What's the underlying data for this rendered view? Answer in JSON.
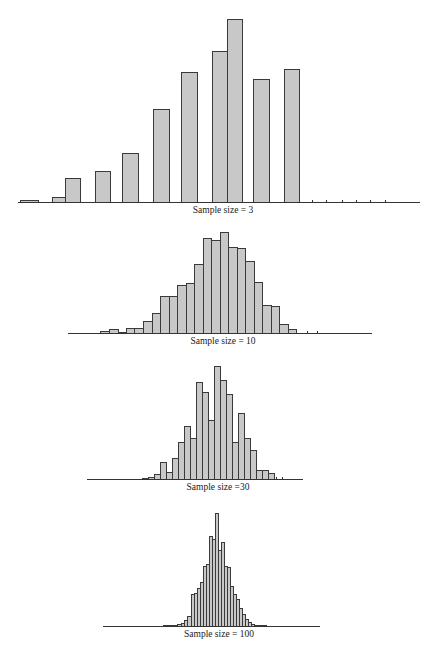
{
  "colors": {
    "bar_fill": "#c8c8c8",
    "bar_stroke": "#3a3a3a",
    "axis": "#333333"
  },
  "chart_data": [
    {
      "type": "bar",
      "title": "",
      "caption": "Sample size = 3",
      "xlabel": "Sample size = 3",
      "ylabel": "",
      "grid": false,
      "axis": {
        "x1": 18,
        "x2": 420,
        "y": 202
      },
      "caption_pos": {
        "x": 223,
        "y": 205
      },
      "bars": [
        {
          "x": 20,
          "w": 18,
          "h": 2
        },
        {
          "x": 52,
          "w": 13,
          "h": 5
        },
        {
          "x": 65,
          "w": 15,
          "h": 24
        },
        {
          "x": 95,
          "w": 15,
          "h": 31
        },
        {
          "x": 122,
          "w": 16,
          "h": 49
        },
        {
          "x": 153,
          "w": 16,
          "h": 93
        },
        {
          "x": 181,
          "w": 16,
          "h": 130
        },
        {
          "x": 212,
          "w": 15,
          "h": 151
        },
        {
          "x": 227,
          "w": 15,
          "h": 183
        },
        {
          "x": 253,
          "w": 16,
          "h": 123
        },
        {
          "x": 284,
          "w": 15,
          "h": 133
        }
      ],
      "ticks": [
        312,
        326,
        342,
        356,
        370,
        385
      ],
      "values": [
        2,
        5,
        24,
        31,
        49,
        93,
        130,
        151,
        183,
        123,
        133,
        0,
        0,
        0,
        0,
        0,
        0
      ]
    },
    {
      "type": "bar",
      "title": "",
      "caption": "Sample size = 10",
      "xlabel": "Sample size = 10",
      "ylabel": "",
      "grid": false,
      "axis": {
        "x1": 68,
        "x2": 372,
        "y": 333
      },
      "caption_pos": {
        "x": 223,
        "y": 336
      },
      "bars": [
        {
          "x": 100,
          "w": 9,
          "h": 2
        },
        {
          "x": 109,
          "w": 9,
          "h": 4
        },
        {
          "x": 118,
          "w": 8,
          "h": 1
        },
        {
          "x": 126,
          "w": 8,
          "h": 5
        },
        {
          "x": 134,
          "w": 9,
          "h": 5
        },
        {
          "x": 143,
          "w": 9,
          "h": 12
        },
        {
          "x": 152,
          "w": 8,
          "h": 20
        },
        {
          "x": 160,
          "w": 9,
          "h": 37
        },
        {
          "x": 169,
          "w": 8,
          "h": 37
        },
        {
          "x": 177,
          "w": 9,
          "h": 48
        },
        {
          "x": 186,
          "w": 8,
          "h": 50
        },
        {
          "x": 194,
          "w": 9,
          "h": 69
        },
        {
          "x": 203,
          "w": 8,
          "h": 95
        },
        {
          "x": 211,
          "w": 9,
          "h": 93
        },
        {
          "x": 220,
          "w": 8,
          "h": 101
        },
        {
          "x": 228,
          "w": 9,
          "h": 86
        },
        {
          "x": 237,
          "w": 8,
          "h": 85
        },
        {
          "x": 245,
          "w": 9,
          "h": 72
        },
        {
          "x": 254,
          "w": 8,
          "h": 51
        },
        {
          "x": 262,
          "w": 9,
          "h": 28
        },
        {
          "x": 271,
          "w": 8,
          "h": 27
        },
        {
          "x": 279,
          "w": 9,
          "h": 9
        },
        {
          "x": 288,
          "w": 8,
          "h": 4
        }
      ],
      "ticks": [
        307,
        317
      ],
      "values": [
        2,
        4,
        1,
        5,
        5,
        12,
        20,
        37,
        37,
        48,
        50,
        69,
        95,
        93,
        101,
        86,
        85,
        72,
        51,
        28,
        27,
        9,
        4,
        0,
        0
      ]
    },
    {
      "type": "bar",
      "title": "",
      "caption": "Sample size =30",
      "xlabel": "Sample size =30",
      "ylabel": "",
      "grid": false,
      "axis": {
        "x1": 87,
        "x2": 303,
        "y": 479
      },
      "caption_pos": {
        "x": 218,
        "y": 482
      },
      "bars": [
        {
          "x": 142,
          "w": 6,
          "h": 1
        },
        {
          "x": 148,
          "w": 6,
          "h": 2
        },
        {
          "x": 154,
          "w": 6,
          "h": 5
        },
        {
          "x": 160,
          "w": 6,
          "h": 17
        },
        {
          "x": 166,
          "w": 6,
          "h": 7
        },
        {
          "x": 172,
          "w": 6,
          "h": 21
        },
        {
          "x": 178,
          "w": 6,
          "h": 37
        },
        {
          "x": 184,
          "w": 6,
          "h": 53
        },
        {
          "x": 190,
          "w": 6,
          "h": 41
        },
        {
          "x": 196,
          "w": 6,
          "h": 97
        },
        {
          "x": 202,
          "w": 6,
          "h": 87
        },
        {
          "x": 208,
          "w": 6,
          "h": 59
        },
        {
          "x": 214,
          "w": 6,
          "h": 113
        },
        {
          "x": 220,
          "w": 6,
          "h": 99
        },
        {
          "x": 226,
          "w": 6,
          "h": 85
        },
        {
          "x": 232,
          "w": 6,
          "h": 37
        },
        {
          "x": 238,
          "w": 6,
          "h": 66
        },
        {
          "x": 244,
          "w": 6,
          "h": 41
        },
        {
          "x": 250,
          "w": 6,
          "h": 29
        },
        {
          "x": 256,
          "w": 6,
          "h": 9
        },
        {
          "x": 262,
          "w": 6,
          "h": 9
        },
        {
          "x": 268,
          "w": 6,
          "h": 6
        }
      ],
      "ticks": [
        276,
        282
      ],
      "values": [
        1,
        2,
        5,
        17,
        7,
        21,
        37,
        53,
        41,
        97,
        87,
        59,
        113,
        99,
        85,
        37,
        66,
        41,
        29,
        9,
        9,
        6,
        0,
        0
      ]
    },
    {
      "type": "bar",
      "title": "",
      "caption": "Sample size = 100",
      "xlabel": "Sample size = 100",
      "ylabel": "",
      "grid": false,
      "axis": {
        "x1": 103,
        "x2": 320,
        "y": 626
      },
      "caption_pos": {
        "x": 219,
        "y": 629
      },
      "bars": [
        {
          "x": 163,
          "w": 14,
          "h": 1
        },
        {
          "x": 177,
          "w": 4,
          "h": 2
        },
        {
          "x": 181,
          "w": 3,
          "h": 3
        },
        {
          "x": 184,
          "w": 3,
          "h": 6
        },
        {
          "x": 187,
          "w": 4,
          "h": 10
        },
        {
          "x": 191,
          "w": 3,
          "h": 32
        },
        {
          "x": 194,
          "w": 3,
          "h": 33
        },
        {
          "x": 197,
          "w": 3,
          "h": 38
        },
        {
          "x": 200,
          "w": 3,
          "h": 44
        },
        {
          "x": 203,
          "w": 3,
          "h": 60
        },
        {
          "x": 206,
          "w": 3,
          "h": 62
        },
        {
          "x": 209,
          "w": 3,
          "h": 90
        },
        {
          "x": 212,
          "w": 3,
          "h": 87
        },
        {
          "x": 215,
          "w": 3,
          "h": 113
        },
        {
          "x": 218,
          "w": 3,
          "h": 76
        },
        {
          "x": 221,
          "w": 3,
          "h": 84
        },
        {
          "x": 224,
          "w": 3,
          "h": 60
        },
        {
          "x": 227,
          "w": 3,
          "h": 59
        },
        {
          "x": 230,
          "w": 3,
          "h": 40
        },
        {
          "x": 233,
          "w": 3,
          "h": 32
        },
        {
          "x": 236,
          "w": 3,
          "h": 27
        },
        {
          "x": 239,
          "w": 3,
          "h": 18
        },
        {
          "x": 242,
          "w": 3,
          "h": 12
        },
        {
          "x": 245,
          "w": 3,
          "h": 7
        },
        {
          "x": 248,
          "w": 3,
          "h": 4
        },
        {
          "x": 251,
          "w": 3,
          "h": 2
        },
        {
          "x": 254,
          "w": 4,
          "h": 1
        },
        {
          "x": 258,
          "w": 8,
          "h": 1
        }
      ],
      "ticks": [],
      "values": [
        1,
        2,
        3,
        6,
        10,
        32,
        33,
        38,
        44,
        60,
        62,
        90,
        87,
        113,
        76,
        84,
        60,
        59,
        40,
        32,
        27,
        18,
        12,
        7,
        4,
        2,
        1,
        1
      ]
    }
  ]
}
